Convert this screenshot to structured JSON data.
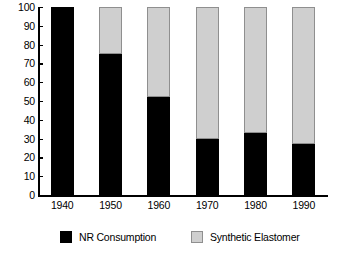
{
  "chart_data": {
    "type": "bar",
    "subtype": "stacked-bar-100-percent",
    "title": "",
    "subtitle": "",
    "xlabel": "",
    "ylabel": "",
    "categories": [
      "1940",
      "1950",
      "1960",
      "1970",
      "1980",
      "1990"
    ],
    "series": [
      {
        "name": "NR Consumption",
        "color": "#000000",
        "values": [
          100,
          75,
          52,
          30,
          33,
          27
        ]
      },
      {
        "name": "Synthetic Elastomer",
        "color": "#cfcfcf",
        "values": [
          0,
          25,
          48,
          70,
          67,
          73
        ]
      }
    ],
    "ylim": [
      0,
      100
    ],
    "y_ticks": [
      0,
      10,
      20,
      30,
      40,
      50,
      60,
      70,
      80,
      90,
      100
    ],
    "y_tick_labels": [
      "0",
      "10",
      "20",
      "30",
      "40",
      "50",
      "60",
      "70",
      "80",
      "90",
      "100"
    ],
    "x_tick_labels": [
      "1940",
      "1950",
      "1960",
      "1970",
      "1980",
      "1990"
    ],
    "grid": false,
    "legend": {
      "position": "bottom",
      "entries": [
        {
          "label": "NR Consumption",
          "swatch": "black-square-swatch",
          "color": "#000000"
        },
        {
          "label": "Synthetic Elastomer",
          "swatch": "gray-square-swatch",
          "color": "#cfcfcf"
        }
      ]
    },
    "colors": {
      "background": "#ffffff",
      "axis": "#000000",
      "nr_consumption": "#000000",
      "synthetic_elastomer": "#cfcfcf",
      "synthetic_elastomer_border": "#8f8f8f"
    }
  }
}
